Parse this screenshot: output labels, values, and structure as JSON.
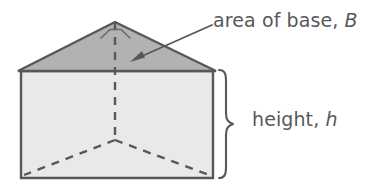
{
  "figure": {
    "name": "triangular-prism-diagram",
    "shape": "triangular prism",
    "background_color": "#ffffff",
    "line_color": "#58585a",
    "top_face_fill": "#b2b2b2",
    "front_face_fill": "#e9e9e9",
    "text_color": "#58585a"
  },
  "labels": {
    "base": {
      "text": "area of base, ",
      "variable": "B",
      "full": "area of base, B"
    },
    "height": {
      "text": "height, ",
      "variable": "h",
      "full": "height, h"
    }
  },
  "geometry": {
    "apex": [
      115,
      22
    ],
    "top_face_left_vertex": [
      18,
      71
    ],
    "top_face_right_vertex": [
      216,
      71
    ],
    "rect_top_left": [
      21,
      71
    ],
    "rect_top_right": [
      213,
      71
    ],
    "rect_bottom_right": [
      213,
      178
    ],
    "rect_bottom_left": [
      21,
      178
    ],
    "center_vertex": [
      115,
      140
    ],
    "right_angle_marker": "near apex",
    "brace_top": 70,
    "brace_bottom": 178,
    "arrow_from": [
      212,
      26
    ],
    "arrow_to": [
      132,
      62
    ]
  }
}
